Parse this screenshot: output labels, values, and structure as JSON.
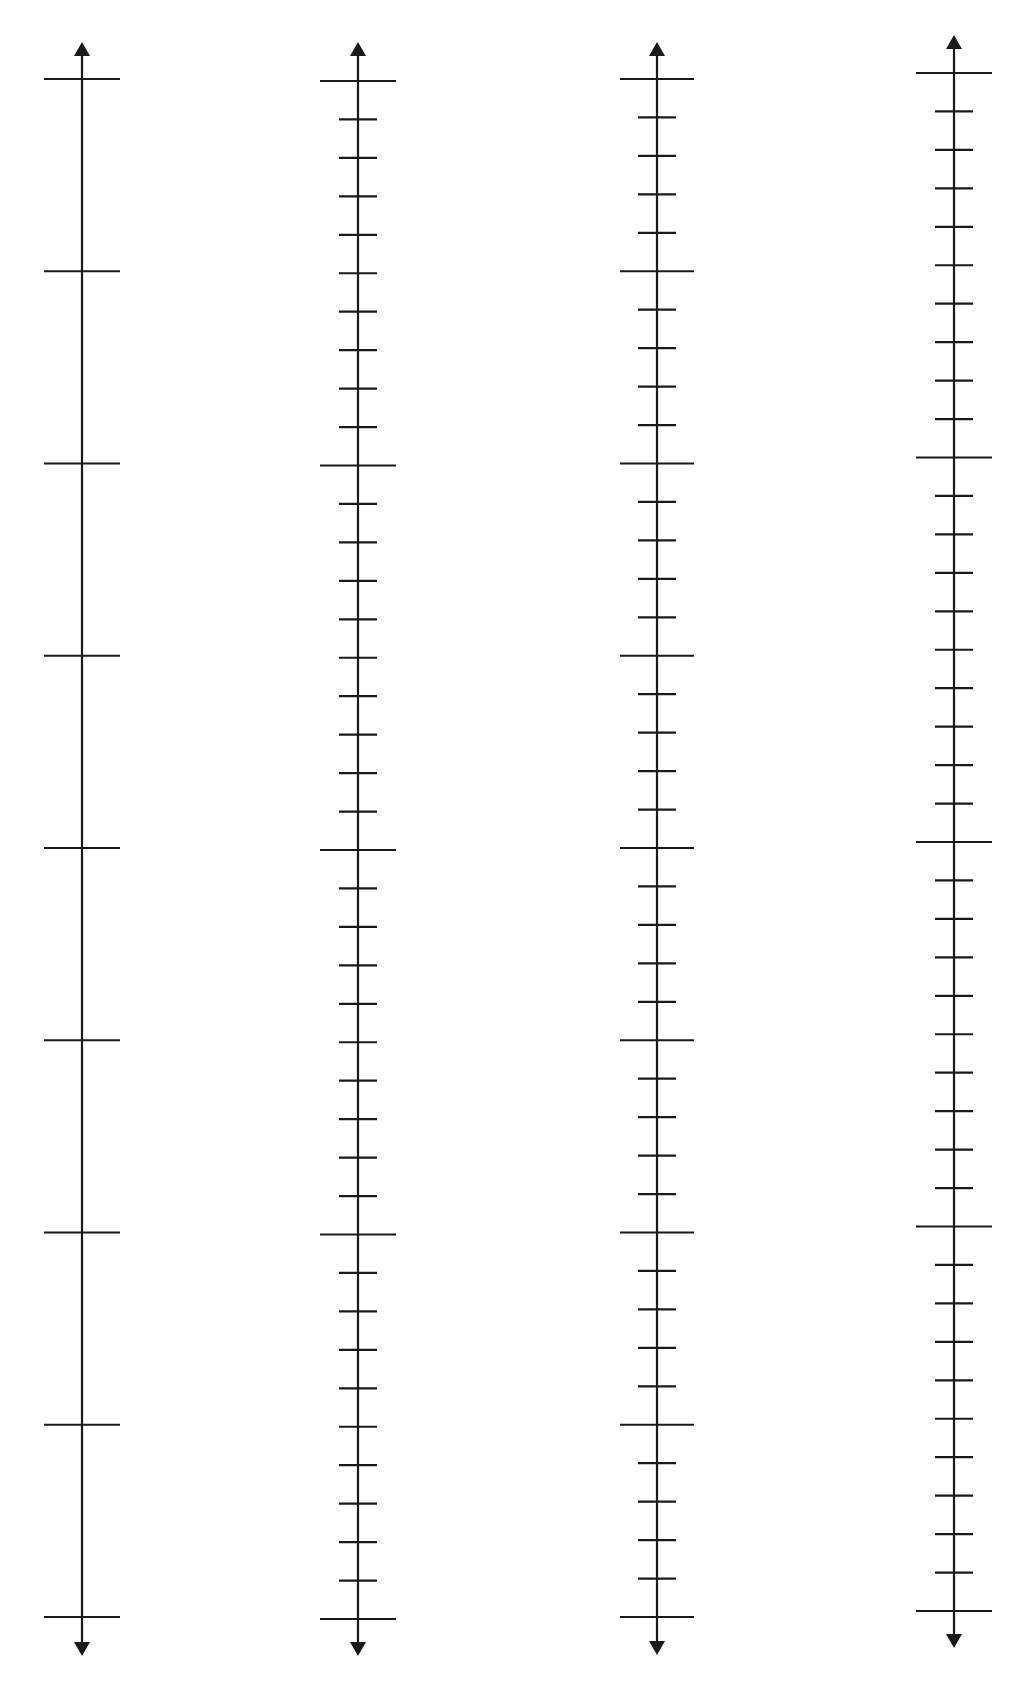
{
  "page": {
    "width": 1026,
    "height": 1682,
    "background": "#ffffff",
    "stroke_color": "#1a1a1a"
  },
  "number_lines": [
    {
      "id": "line-1",
      "x": 82,
      "arrow_top_y": 42,
      "arrow_bottom_y": 1656,
      "first_tick_y": 79,
      "last_tick_y": 1617,
      "intervals": 8,
      "major_every": 1,
      "major_half_width": 38,
      "minor_half_width": 19
    },
    {
      "id": "line-2",
      "x": 358,
      "arrow_top_y": 42,
      "arrow_bottom_y": 1656,
      "first_tick_y": 81,
      "last_tick_y": 1619,
      "intervals": 40,
      "major_every": 10,
      "major_half_width": 38,
      "minor_half_width": 19
    },
    {
      "id": "line-3",
      "x": 657,
      "arrow_top_y": 42,
      "arrow_bottom_y": 1655,
      "first_tick_y": 79,
      "last_tick_y": 1617,
      "intervals": 40,
      "major_every": 5,
      "major_half_width": 37,
      "minor_half_width": 19
    },
    {
      "id": "line-4",
      "x": 954,
      "arrow_top_y": 35,
      "arrow_bottom_y": 1648,
      "first_tick_y": 73,
      "last_tick_y": 1611,
      "intervals": 40,
      "major_every": 10,
      "major_half_width": 38,
      "minor_half_width": 19
    }
  ]
}
